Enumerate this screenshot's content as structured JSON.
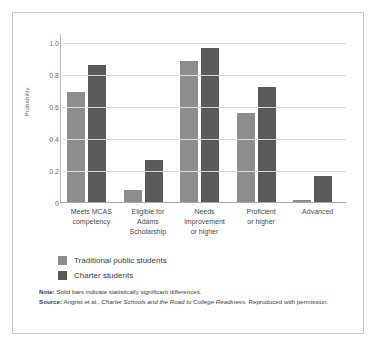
{
  "chart_data": {
    "type": "bar",
    "title": "",
    "xlabel": "",
    "ylabel": "Probability",
    "ylim": [
      0,
      1.05
    ],
    "yticks": [
      "0",
      "0.2",
      "0.4",
      "0.6",
      "0.8",
      "1.0"
    ],
    "ytick_values": [
      0,
      0.2,
      0.4,
      0.6,
      0.8,
      1.0
    ],
    "grid": true,
    "legend_position": "below-left",
    "categories": [
      "Meets MCAS competency",
      "Eligible for Adams Scholarship",
      "Needs improvement or higher",
      "Proficient or higher",
      "Advanced"
    ],
    "category_lines": [
      [
        "Meets MCAS",
        "competency"
      ],
      [
        "Eligible for",
        "Adams",
        "Scholarship"
      ],
      [
        "Needs",
        "improvement",
        "or higher"
      ],
      [
        "Proficient",
        "or higher"
      ],
      [
        "Advanced"
      ]
    ],
    "series": [
      {
        "name": "Traditional public students",
        "color": "#8d8d8d",
        "values": [
          0.69,
          0.075,
          0.88,
          0.555,
          0.01
        ]
      },
      {
        "name": "Charter students",
        "color": "#5a5a5a",
        "values": [
          0.855,
          0.26,
          0.965,
          0.72,
          0.16
        ]
      }
    ]
  },
  "legend": {
    "items": [
      {
        "label": "Traditional public students",
        "color": "#8d8d8d"
      },
      {
        "label": "Charter students",
        "color": "#5a5a5a"
      }
    ]
  },
  "footnotes": {
    "note_label": "Note:",
    "note_text": " Solid bars indicate statistically significant differences.",
    "source_label": "Source:",
    "source_pre": " Angrist et al., ",
    "source_italic": "Charter Schools and the Road to College Readiness",
    "source_post": ". Reproduced with permission."
  },
  "colors": {
    "light_bar": "#8d8d8d",
    "dark_bar": "#5a5a5a",
    "gridline": "#d8d8d8",
    "frame": "#c9c9c9"
  }
}
